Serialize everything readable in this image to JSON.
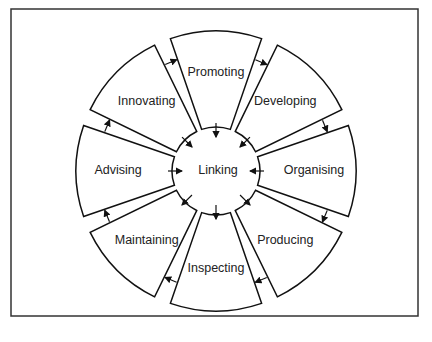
{
  "center": {
    "label": "Linking"
  },
  "segments": [
    {
      "label": "Promoting",
      "angle": 0
    },
    {
      "label": "Developing",
      "angle": 45
    },
    {
      "label": "Organising",
      "angle": 90
    },
    {
      "label": "Producing",
      "angle": 135
    },
    {
      "label": "Inspecting",
      "angle": 180
    },
    {
      "label": "Maintaining",
      "angle": 225
    },
    {
      "label": "Advising",
      "angle": 270
    },
    {
      "label": "Innovating",
      "angle": 315
    }
  ],
  "flow_direction": "clockwise",
  "center_arrows": [
    {
      "segment": "Promoting",
      "direction": "in"
    },
    {
      "segment": "Developing",
      "direction": "in"
    },
    {
      "segment": "Organising",
      "direction": "in"
    },
    {
      "segment": "Producing",
      "direction": "out"
    },
    {
      "segment": "Inspecting",
      "direction": "out"
    },
    {
      "segment": "Maintaining",
      "direction": "out"
    },
    {
      "segment": "Advising",
      "direction": "in"
    },
    {
      "segment": "Innovating",
      "direction": "in"
    }
  ],
  "colors": {
    "stroke": "#111111",
    "background": "#ffffff"
  }
}
